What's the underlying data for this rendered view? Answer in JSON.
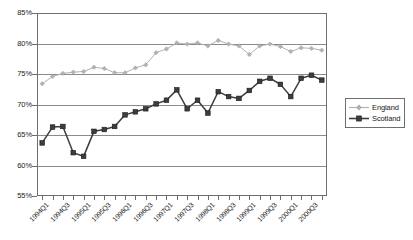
{
  "chart_data": {
    "type": "line",
    "title": "",
    "subtitle": "",
    "xlabel": "",
    "ylabel": "",
    "ylim": [
      55,
      85
    ],
    "ytick_labels": [
      "55%",
      "60%",
      "65%",
      "70%",
      "75%",
      "80%",
      "85%"
    ],
    "ytick_values": [
      55,
      60,
      65,
      70,
      75,
      80,
      85
    ],
    "grid": true,
    "legend_position": "right",
    "x": [
      "1994Q1",
      "1994Q2",
      "1994Q3",
      "1994Q4",
      "1995Q1",
      "1995Q2",
      "1995Q3",
      "1995Q4",
      "1996Q1",
      "1996Q2",
      "1996Q3",
      "1996Q4",
      "1997Q1",
      "1997Q2",
      "1997Q3",
      "1997Q4",
      "1998Q1",
      "1998Q2",
      "1998Q3",
      "1998Q4",
      "1999Q1",
      "1999Q2",
      "1999Q3",
      "1999Q4",
      "2000Q1",
      "2000Q2",
      "2000Q3",
      "2000Q4"
    ],
    "xtick_labels": [
      "1994Q1",
      "1994Q3",
      "1995Q1",
      "1995Q3",
      "1996Q1",
      "1996Q3",
      "1997Q1",
      "1997Q3",
      "1998Q1",
      "1998Q3",
      "1999Q1",
      "1999Q3",
      "2000Q1",
      "2000Q3"
    ],
    "series": [
      {
        "name": "England",
        "color": "#b3b3b3",
        "marker": "diamond",
        "values": [
          73.4,
          74.6,
          75.1,
          75.3,
          75.4,
          76.1,
          75.9,
          75.2,
          75.2,
          76.0,
          76.5,
          78.5,
          79.1,
          80.1,
          79.9,
          80.1,
          79.6,
          80.5,
          79.9,
          79.6,
          78.2,
          79.6,
          79.9,
          79.5,
          78.7,
          79.3,
          79.2,
          78.9
        ]
      },
      {
        "name": "Scotland",
        "color": "#3d3d3d",
        "marker": "square",
        "values": [
          63.7,
          66.3,
          66.4,
          62.1,
          61.5,
          65.6,
          65.9,
          66.4,
          68.3,
          68.8,
          69.3,
          70.1,
          70.7,
          72.4,
          69.3,
          70.7,
          68.6,
          72.1,
          71.3,
          71.0,
          72.3,
          73.8,
          74.3,
          73.3,
          71.3,
          74.3,
          74.8,
          74.0
        ]
      }
    ]
  },
  "legend": {
    "items": [
      {
        "label": "England"
      },
      {
        "label": "Scotland"
      }
    ]
  }
}
